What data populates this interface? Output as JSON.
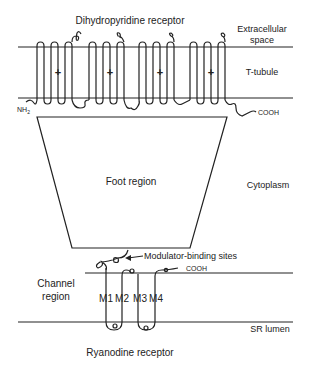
{
  "diagram": {
    "title_top": "Dihydropyridine receptor",
    "title_bottom": "Ryanodine receptor",
    "regions": {
      "extracellular_line1": "Extracellular",
      "extracellular_line2": "space",
      "t_tubule": "T-tubule",
      "cytoplasm": "Cytoplasm",
      "sr_lumen": "SR lumen",
      "channel_line1": "Channel",
      "channel_line2": "region"
    },
    "foot": "Foot region",
    "modulator": "Modulator-binding sites",
    "termini": {
      "dhpr_n": "NH",
      "dhpr_n_sub": "2",
      "dhpr_c": "COOH",
      "ryr_c": "COOH"
    },
    "charges": [
      "+",
      "+",
      "+",
      "+"
    ],
    "segments": [
      "M1",
      "M2",
      "M3",
      "M4"
    ],
    "colors": {
      "ink": "#222222",
      "background": "#ffffff"
    }
  }
}
